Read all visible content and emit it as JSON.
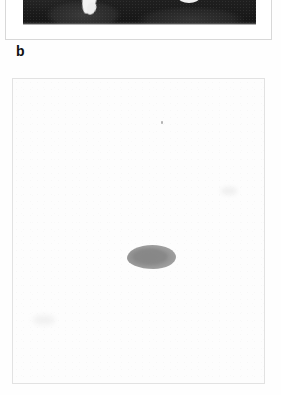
{
  "figure": {
    "type": "scientific-figure",
    "background_color": "#fdfdfd"
  },
  "panel_a": {
    "name": "a",
    "label": "",
    "cropped": true,
    "image_kind": "autoradiograph-gel",
    "background_color": "#1e1e1e",
    "border_color": "#d8d8d8",
    "bands": [
      {
        "id": "band-left",
        "appearance": "white tapered streak",
        "color": "#f2f2f2"
      },
      {
        "id": "band-right",
        "appearance": "white oval blob",
        "color": "#f0f0f0"
      }
    ]
  },
  "panel_b": {
    "name": "b",
    "label": "b",
    "image_kind": "blot-film",
    "background_color": "#fdfdfd",
    "border_color": "#e2e2e2",
    "bands": [
      {
        "id": "band-main",
        "appearance": "single grey elongated oval band, centre of film",
        "color": "#8b8b8b"
      },
      {
        "id": "speck",
        "appearance": "tiny faint grey speck, upper centre",
        "color": "#9a9a9a"
      }
    ]
  }
}
